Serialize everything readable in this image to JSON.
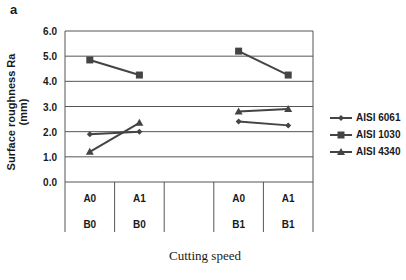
{
  "chart_data": {
    "type": "line",
    "panel_label": "a",
    "title": "",
    "xlabel": "Cutting speed",
    "ylabel": "Surface roughness Ra (mm)",
    "ylim": [
      0,
      6
    ],
    "yticks": [
      "0.0",
      "1.0",
      "2.0",
      "3.0",
      "4.0",
      "5.0",
      "6.0"
    ],
    "categories": [
      {
        "top": "A0",
        "bottom": "B0"
      },
      {
        "top": "A1",
        "bottom": "B0"
      },
      {
        "top": "",
        "bottom": ""
      },
      {
        "top": "A0",
        "bottom": "B1"
      },
      {
        "top": "A1",
        "bottom": "B1"
      }
    ],
    "series": [
      {
        "name": "AISI 6061",
        "marker": "diamond",
        "segments": [
          [
            1.9,
            2.0
          ],
          [
            2.4,
            2.25
          ]
        ]
      },
      {
        "name": "AISI 1030",
        "marker": "square",
        "segments": [
          [
            4.85,
            4.25
          ],
          [
            5.2,
            4.25
          ]
        ]
      },
      {
        "name": "AISI 4340",
        "marker": "triangle",
        "segments": [
          [
            1.2,
            2.35
          ],
          [
            2.8,
            2.9
          ]
        ]
      }
    ],
    "grid": true,
    "legend_position": "right"
  }
}
